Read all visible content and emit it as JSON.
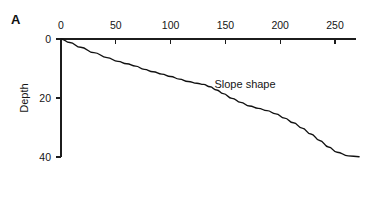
{
  "figure": {
    "panel_label": "A"
  },
  "chart_data": {
    "type": "line",
    "title": "",
    "subtitle": "",
    "xlabel": "",
    "ylabel": "Depth",
    "xlim": [
      0,
      275
    ],
    "ylim": [
      0,
      40
    ],
    "y_axis_inverted": true,
    "x_axis_position": "top",
    "grid": false,
    "legend": false,
    "legend_position": "none",
    "xticks": [
      0,
      50,
      100,
      150,
      200,
      250
    ],
    "xticklabels": [
      "0",
      "50",
      "100",
      "150",
      "200",
      "250"
    ],
    "yticks": [
      0,
      20,
      40
    ],
    "yticklabels": [
      "0",
      "20",
      "40"
    ],
    "annotations": [
      {
        "text": "Slope shape",
        "x": 140,
        "y": 16.5
      }
    ],
    "series": [
      {
        "name": "Slope shape",
        "x": [
          0,
          8,
          18,
          30,
          42,
          52,
          60,
          68,
          76,
          84,
          92,
          100,
          108,
          116,
          124,
          130,
          136,
          142,
          148,
          156,
          164,
          172,
          180,
          188,
          196,
          204,
          212,
          220,
          228,
          236,
          244,
          252,
          262,
          272
        ],
        "y": [
          0.0,
          1.2,
          2.8,
          4.6,
          6.3,
          7.6,
          8.4,
          9.2,
          10.3,
          11.1,
          11.9,
          12.7,
          13.6,
          14.4,
          15.0,
          15.4,
          16.2,
          17.3,
          18.5,
          20.1,
          21.5,
          22.7,
          23.5,
          24.3,
          25.4,
          26.8,
          28.4,
          30.2,
          32.2,
          34.4,
          36.6,
          38.4,
          39.6,
          39.9
        ]
      }
    ]
  }
}
